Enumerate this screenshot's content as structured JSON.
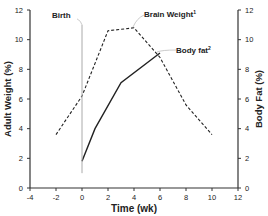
{
  "chart_data": {
    "type": "line",
    "title": "",
    "xlabel": "Time (wk)",
    "ylabel": "Adult Weight (%)",
    "ylabel_right": "Body Fat (%)",
    "xlim": [
      -4,
      12
    ],
    "ylim": [
      0,
      12
    ],
    "ylim_right": [
      0,
      12
    ],
    "x_ticks": [
      "-4",
      "-2",
      "0",
      "2",
      "4",
      "6",
      "8",
      "10",
      "12"
    ],
    "y_ticks": [
      "0",
      "2",
      "4",
      "6",
      "8",
      "10",
      "12"
    ],
    "y_ticks_right": [
      "0",
      "2",
      "4",
      "6",
      "8",
      "10",
      "12"
    ],
    "grid": false,
    "series": [
      {
        "name": "Brain Weight¹",
        "style": "dashed",
        "axis": "left",
        "x": [
          -2,
          0,
          2,
          4,
          6,
          8,
          10
        ],
        "values": [
          3.6,
          6.2,
          10.6,
          10.8,
          8.8,
          5.6,
          3.6
        ]
      },
      {
        "name": "Body fat²",
        "style": "solid",
        "axis": "right",
        "x": [
          0,
          1,
          3,
          6
        ],
        "values": [
          1.8,
          4.0,
          7.1,
          9.1
        ]
      }
    ],
    "annotations": [
      {
        "text": "Birth",
        "type": "vertical-line",
        "x": 0,
        "y_range": [
          1.0,
          11.0
        ]
      },
      {
        "text": "Brain Weight¹",
        "points_to": "brain-weight-series"
      },
      {
        "text": "Body fat²",
        "points_to": "body-fat-series"
      }
    ]
  },
  "labels": {
    "birth": "Birth",
    "brain": "Brain Weight",
    "brain_sup": "1",
    "bodyfat": "Body fat",
    "bodyfat_sup": "2",
    "xlabel": "Time (wk)",
    "ylabel": "Adult Weight (%)",
    "ylabel_right": "Body Fat (%)"
  }
}
